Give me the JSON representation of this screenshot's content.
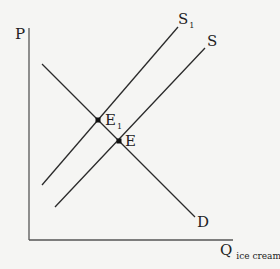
{
  "diagram": {
    "type": "supply-demand",
    "axes": {
      "y_label": "P",
      "x_label_main": "Q",
      "x_label_sub": "ice cream"
    },
    "curves": [
      {
        "id": "S1",
        "label_main": "S",
        "label_sub": "1",
        "type": "supply",
        "from": [
          42,
          185
        ],
        "to": [
          178,
          27
        ]
      },
      {
        "id": "S",
        "label_main": "S",
        "label_sub": "",
        "type": "supply",
        "from": [
          55,
          207
        ],
        "to": [
          205,
          48
        ]
      },
      {
        "id": "D",
        "label_main": "D",
        "label_sub": "",
        "type": "demand",
        "from": [
          42,
          64
        ],
        "to": [
          195,
          217
        ]
      }
    ],
    "points": [
      {
        "id": "E1",
        "label_main": "E",
        "label_sub": "1",
        "at": [
          98,
          120
        ]
      },
      {
        "id": "E",
        "label_main": "E",
        "label_sub": "",
        "at": [
          119,
          141
        ]
      }
    ],
    "colors": {
      "background": "#f5f5f3",
      "line": "#2a2a2a",
      "axis": "#555555",
      "text": "#222222"
    }
  }
}
